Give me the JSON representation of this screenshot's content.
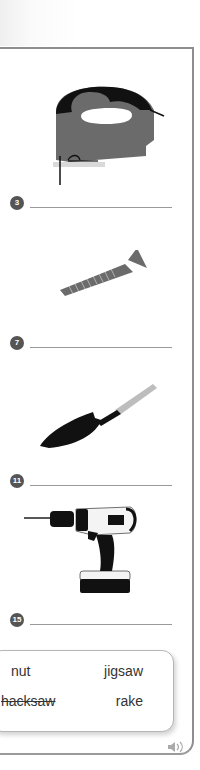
{
  "exercise": {
    "items": [
      {
        "number": "3",
        "illustration": "jigsaw-illustration",
        "answer": ""
      },
      {
        "number": "7",
        "illustration": "screw-illustration",
        "answer": ""
      },
      {
        "number": "11",
        "illustration": "trowel-illustration",
        "answer": ""
      },
      {
        "number": "15",
        "illustration": "cordless-drill-illustration",
        "answer": ""
      }
    ],
    "word_bank": {
      "words": [
        {
          "label": "nut",
          "struck": false
        },
        {
          "label": "jigsaw",
          "struck": false
        },
        {
          "label": "hacksaw",
          "struck": true
        },
        {
          "label": "rake",
          "struck": false
        }
      ]
    },
    "audio_icon": "speaker-icon"
  },
  "colors": {
    "badge": "#555555",
    "tool_gray": "#6b6b6b",
    "tool_black": "#111111",
    "border": "#8e8e8e"
  }
}
